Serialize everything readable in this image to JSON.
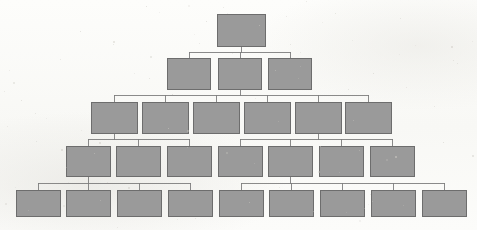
{
  "diagram": {
    "kind": "organization-tree",
    "background_color": "#fbfbf9",
    "node_fill_color": "#9a9a9a",
    "node_border_color": "#6d6d6d",
    "edge_color": "#7d7d7d",
    "levels": [
      {
        "index": 0,
        "node_count": 1,
        "nodes": [
          {
            "id": "n0-1",
            "label": "",
            "x": 217,
            "y": 14,
            "w": 48,
            "h": 32
          }
        ]
      },
      {
        "index": 1,
        "node_count": 3,
        "nodes": [
          {
            "id": "n1-1",
            "label": "",
            "x": 167,
            "y": 58,
            "w": 43,
            "h": 31
          },
          {
            "id": "n1-2",
            "label": "",
            "x": 218,
            "y": 58,
            "w": 43,
            "h": 31
          },
          {
            "id": "n1-3",
            "label": "",
            "x": 268,
            "y": 58,
            "w": 43,
            "h": 31
          }
        ]
      },
      {
        "index": 2,
        "node_count": 6,
        "nodes": [
          {
            "id": "n2-1",
            "label": "",
            "x": 91,
            "y": 102,
            "w": 46,
            "h": 31
          },
          {
            "id": "n2-2",
            "label": "",
            "x": 142,
            "y": 102,
            "w": 46,
            "h": 31
          },
          {
            "id": "n2-3",
            "label": "",
            "x": 193,
            "y": 102,
            "w": 46,
            "h": 31
          },
          {
            "id": "n2-4",
            "label": "",
            "x": 244,
            "y": 102,
            "w": 46,
            "h": 31
          },
          {
            "id": "n2-5",
            "label": "",
            "x": 295,
            "y": 102,
            "w": 46,
            "h": 31
          },
          {
            "id": "n2-6",
            "label": "",
            "x": 345,
            "y": 102,
            "w": 46,
            "h": 31
          }
        ]
      },
      {
        "index": 3,
        "node_count": 7,
        "nodes": [
          {
            "id": "n3-1",
            "label": "",
            "x": 66,
            "y": 146,
            "w": 44,
            "h": 30
          },
          {
            "id": "n3-2",
            "label": "",
            "x": 116,
            "y": 146,
            "w": 44,
            "h": 30
          },
          {
            "id": "n3-3",
            "label": "",
            "x": 167,
            "y": 146,
            "w": 44,
            "h": 30
          },
          {
            "id": "n3-4",
            "label": "",
            "x": 218,
            "y": 146,
            "w": 44,
            "h": 30
          },
          {
            "id": "n3-5",
            "label": "",
            "x": 268,
            "y": 146,
            "w": 44,
            "h": 30
          },
          {
            "id": "n3-6",
            "label": "",
            "x": 319,
            "y": 146,
            "w": 44,
            "h": 30
          },
          {
            "id": "n3-7",
            "label": "",
            "x": 370,
            "y": 146,
            "w": 44,
            "h": 30
          }
        ]
      },
      {
        "index": 4,
        "node_count": 9,
        "nodes": [
          {
            "id": "n4-1",
            "label": "",
            "x": 16,
            "y": 190,
            "w": 44,
            "h": 26
          },
          {
            "id": "n4-2",
            "label": "",
            "x": 66,
            "y": 190,
            "w": 44,
            "h": 26
          },
          {
            "id": "n4-3",
            "label": "",
            "x": 117,
            "y": 190,
            "w": 44,
            "h": 26
          },
          {
            "id": "n4-4",
            "label": "",
            "x": 168,
            "y": 190,
            "w": 44,
            "h": 26
          },
          {
            "id": "n4-5",
            "label": "",
            "x": 219,
            "y": 190,
            "w": 44,
            "h": 26
          },
          {
            "id": "n4-6",
            "label": "",
            "x": 269,
            "y": 190,
            "w": 44,
            "h": 26
          },
          {
            "id": "n4-7",
            "label": "",
            "x": 320,
            "y": 190,
            "w": 44,
            "h": 26
          },
          {
            "id": "n4-8",
            "label": "",
            "x": 371,
            "y": 190,
            "w": 44,
            "h": 26
          },
          {
            "id": "n4-9",
            "label": "",
            "x": 422,
            "y": 190,
            "w": 44,
            "h": 26
          }
        ]
      }
    ],
    "connectors": [
      {
        "id": "c0",
        "parent": "n0-1",
        "bus_y": 52,
        "children": [
          "n1-1",
          "n1-2",
          "n1-3"
        ]
      },
      {
        "id": "c1",
        "parent": "n1-2",
        "bus_y": 95,
        "children": [
          "n2-1",
          "n2-2",
          "n2-3",
          "n2-4",
          "n2-5",
          "n2-6"
        ]
      },
      {
        "id": "c2",
        "parent": "n2-1",
        "bus_y": 139,
        "children": [
          "n3-1",
          "n3-2",
          "n3-3"
        ]
      },
      {
        "id": "c3",
        "parent": "n2-5",
        "bus_y": 139,
        "children": [
          "n3-4",
          "n3-5",
          "n3-6",
          "n3-7"
        ]
      },
      {
        "id": "c4",
        "parent": "n3-1",
        "bus_y": 183,
        "children": [
          "n4-1",
          "n4-2",
          "n4-3",
          "n4-4"
        ]
      },
      {
        "id": "c5",
        "parent": "n3-5",
        "bus_y": 183,
        "children": [
          "n4-5",
          "n4-6",
          "n4-7",
          "n4-8",
          "n4-9"
        ]
      }
    ]
  }
}
